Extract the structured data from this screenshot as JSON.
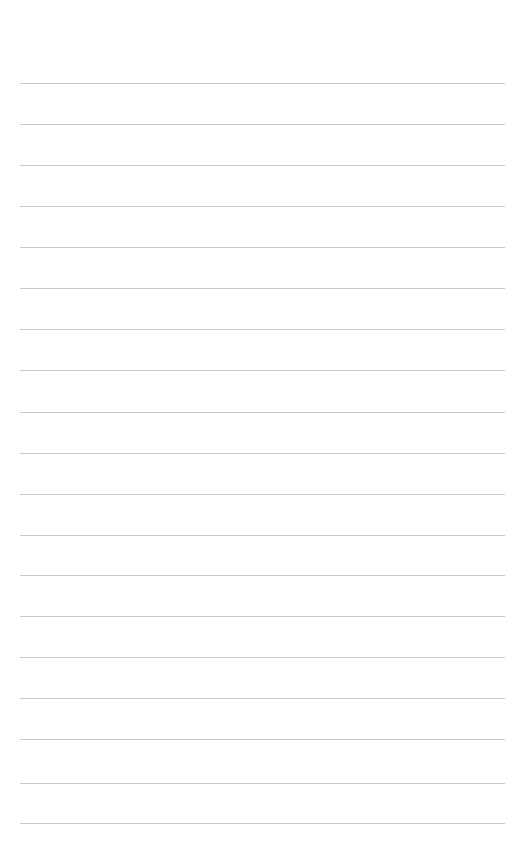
{
  "page": {
    "type": "lined-paper",
    "background_color": "#ffffff",
    "rule_color": "#c9c9c9",
    "rule_count": 19,
    "rule_positions_y": [
      83,
      124,
      165,
      206,
      247,
      288,
      329,
      370,
      412,
      453,
      494,
      535,
      575,
      616,
      657,
      698,
      739,
      783,
      823
    ],
    "rule_x_start": 20,
    "rule_x_end": 505,
    "text_content": []
  }
}
